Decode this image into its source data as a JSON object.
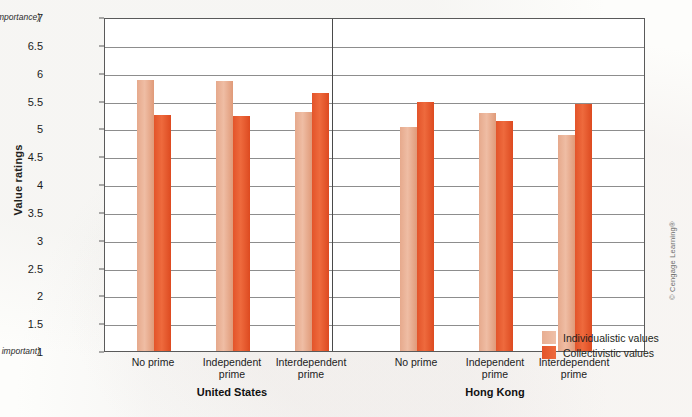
{
  "figure": {
    "y_axis_title": "Value ratings",
    "top_annotation": "(Supreme importance)",
    "bottom_annotation": "(Not important)",
    "copyright": "© Cengage Learning®"
  },
  "legend": {
    "position": "right-bottom",
    "entries": [
      {
        "label": "Individualistic values",
        "color": "#e8ae92"
      },
      {
        "label": "Collectivistic values",
        "color": "#e3542a"
      }
    ]
  },
  "chart_data": {
    "type": "bar",
    "title": "",
    "xlabel": "",
    "ylabel": "Value ratings",
    "ylim": [
      1,
      7
    ],
    "ytick_step": 0.5,
    "yticks": [
      "7",
      "6.5",
      "6",
      "5.5",
      "5",
      "4.5",
      "4",
      "3.5",
      "3",
      "2.5",
      "2",
      "1.5",
      "1"
    ],
    "grid": true,
    "groups": [
      "United States",
      "Hong Kong"
    ],
    "categories": [
      "No prime",
      "Independent prime",
      "Interdependent prime",
      "No prime",
      "Independent prime",
      "Interdependent prime"
    ],
    "category_lines": [
      [
        "No prime",
        ""
      ],
      [
        "Independent",
        "prime"
      ],
      [
        "Interdependent",
        "prime"
      ],
      [
        "No prime",
        ""
      ],
      [
        "Independent",
        "prime"
      ],
      [
        "Interdependent",
        "prime"
      ]
    ],
    "series": [
      {
        "name": "Individualistic values",
        "color": "#e8ae92",
        "values": [
          5.87,
          5.85,
          5.3,
          5.02,
          5.27,
          4.88
        ]
      },
      {
        "name": "Collectivistic values",
        "color": "#e3542a",
        "values": [
          5.24,
          5.23,
          5.63,
          5.47,
          5.14,
          5.44
        ]
      }
    ]
  }
}
